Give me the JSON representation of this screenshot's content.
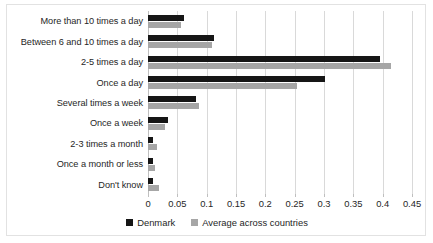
{
  "chart_data": {
    "type": "bar",
    "orientation": "horizontal",
    "title": "",
    "subtitle": "",
    "xlabel": "",
    "ylabel": "",
    "xlim": [
      0,
      0.45
    ],
    "grid": true,
    "legend_position": "bottom",
    "categories": [
      "More than 10 times a day",
      "Between 6 and 10 times a day",
      "2-5 times a day",
      "Once a day",
      "Several times a week",
      "Once a week",
      "2-3 times a month",
      "Once a month or less",
      "Don't know"
    ],
    "series": [
      {
        "name": "Denmark",
        "color": "#161616",
        "values": [
          0.061,
          0.112,
          0.395,
          0.302,
          0.082,
          0.034,
          0.009,
          0.009,
          0.009
        ]
      },
      {
        "name": "Average across countries",
        "color": "#a6a6a6",
        "values": [
          0.056,
          0.109,
          0.414,
          0.254,
          0.087,
          0.029,
          0.016,
          0.012,
          0.018
        ]
      }
    ],
    "ticks": [
      "0",
      "0.05",
      "0.1",
      "0.15",
      "0.2",
      "0.25",
      "0.3",
      "0.35",
      "0.4",
      "0.45"
    ],
    "tick_values": [
      0,
      0.05,
      0.1,
      0.15,
      0.2,
      0.25,
      0.3,
      0.35,
      0.4,
      0.45
    ]
  },
  "legend": {
    "items": [
      {
        "label": "Denmark",
        "color": "#161616"
      },
      {
        "label": "Average across countries",
        "color": "#a6a6a6"
      }
    ]
  }
}
